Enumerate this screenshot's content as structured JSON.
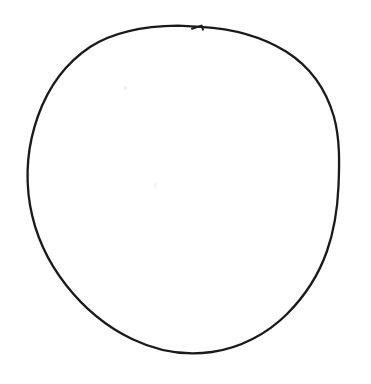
{
  "canvas": {
    "width": 371,
    "height": 384,
    "background_color": "#ffffff",
    "alt_text": "Hand-drawn circle outline"
  },
  "drawing": {
    "name": "hand-drawn-circle",
    "type": "freehand-closed-curve",
    "stroke_color": "#1a1a1a",
    "stroke_width": 2.3,
    "fill": "none",
    "bounds": {
      "left": 28,
      "top": 25,
      "right": 339,
      "bottom": 353,
      "width": 311,
      "height": 328
    },
    "center": {
      "x": 184,
      "y": 189
    },
    "radius_x": 156,
    "radius_y": 164,
    "notes": "Slightly irregular wobbly circle; flattened along lower-right arc; small pen-start notch at top",
    "path": "M 200.5 26.8 C 232 28.5 262 36.5 286 51.5 C 309 66 326 89 334 117 C 340 139 339.5 163 338.5 186 C 337.5 209 334 231 327 251 C 319 274 305 296 287 314 C 267 334 240 348 212 352 C 185 356 157 351 132 339 C 107 327 84 308 66 285 C 48 262 35 234 30 205 C 25 175 28 144 38 116 C 48 88 66 63 90 47 C 113 32 145 26 178 25.6 L 200.5 26.8 Z",
    "start_notch": {
      "name": "pen-start-notch",
      "x": 200,
      "y": 27,
      "path": "M 192 28.8 L 201.5 25.6 L 203 29.6"
    },
    "specks": [
      {
        "name": "speck-upper-left",
        "x": 124,
        "y": 86,
        "color": "#f2f2f2"
      },
      {
        "name": "speck-center",
        "x": 154,
        "y": 183,
        "color": "#f6f6f6"
      }
    ]
  }
}
